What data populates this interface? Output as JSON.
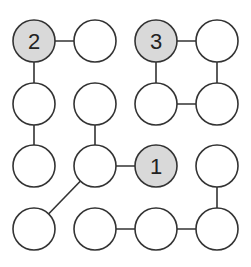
{
  "puzzle": {
    "type": "hashi-like node connection puzzle",
    "rows": 4,
    "cols": 4,
    "colors": {
      "background": "#ffffff",
      "stroke": "#333333",
      "node_fill": "#ffffff",
      "clue_fill": "#d9d9d9",
      "text": "#222222"
    },
    "geometry": {
      "col_x": [
        34,
        95,
        156,
        217
      ],
      "row_y": [
        41,
        104,
        166,
        229
      ],
      "radius": 21
    },
    "nodes": [
      {
        "id": "r0c0",
        "row": 0,
        "col": 0,
        "label": "2",
        "clue": true
      },
      {
        "id": "r0c1",
        "row": 0,
        "col": 1,
        "label": "",
        "clue": false
      },
      {
        "id": "r0c2",
        "row": 0,
        "col": 2,
        "label": "3",
        "clue": true
      },
      {
        "id": "r0c3",
        "row": 0,
        "col": 3,
        "label": "",
        "clue": false
      },
      {
        "id": "r1c0",
        "row": 1,
        "col": 0,
        "label": "",
        "clue": false
      },
      {
        "id": "r1c1",
        "row": 1,
        "col": 1,
        "label": "",
        "clue": false
      },
      {
        "id": "r1c2",
        "row": 1,
        "col": 2,
        "label": "",
        "clue": false
      },
      {
        "id": "r1c3",
        "row": 1,
        "col": 3,
        "label": "",
        "clue": false
      },
      {
        "id": "r2c0",
        "row": 2,
        "col": 0,
        "label": "",
        "clue": false
      },
      {
        "id": "r2c1",
        "row": 2,
        "col": 1,
        "label": "",
        "clue": false
      },
      {
        "id": "r2c2",
        "row": 2,
        "col": 2,
        "label": "1",
        "clue": true
      },
      {
        "id": "r2c3",
        "row": 2,
        "col": 3,
        "label": "",
        "clue": false
      },
      {
        "id": "r3c0",
        "row": 3,
        "col": 0,
        "label": "",
        "clue": false
      },
      {
        "id": "r3c1",
        "row": 3,
        "col": 1,
        "label": "",
        "clue": false
      },
      {
        "id": "r3c2",
        "row": 3,
        "col": 2,
        "label": "",
        "clue": false
      },
      {
        "id": "r3c3",
        "row": 3,
        "col": 3,
        "label": "",
        "clue": false
      }
    ],
    "edges": [
      {
        "from": "r0c0",
        "to": "r0c1"
      },
      {
        "from": "r0c0",
        "to": "r1c0"
      },
      {
        "from": "r1c0",
        "to": "r2c0"
      },
      {
        "from": "r0c2",
        "to": "r0c3"
      },
      {
        "from": "r0c3",
        "to": "r1c3"
      },
      {
        "from": "r1c2",
        "to": "r1c3"
      },
      {
        "from": "r0c2",
        "to": "r1c2"
      },
      {
        "from": "r1c1",
        "to": "r2c1"
      },
      {
        "from": "r2c1",
        "to": "r2c2"
      },
      {
        "from": "r2c1",
        "to": "r3c0"
      },
      {
        "from": "r2c3",
        "to": "r3c3"
      },
      {
        "from": "r3c1",
        "to": "r3c2"
      },
      {
        "from": "r3c2",
        "to": "r3c3"
      }
    ]
  }
}
